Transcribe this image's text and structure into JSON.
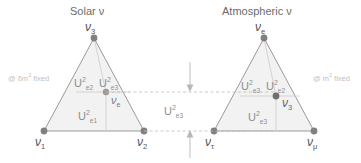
{
  "figure": {
    "type": "ternary-diagram",
    "colors": {
      "outline": "#9a9a9a",
      "fill": "#f2f2f2",
      "inner_line": "#c9c9c9",
      "dot": "#808080",
      "dashed": "#bdbdbd",
      "text": "#5a5a5a",
      "faint_text": "#c2c2c2"
    }
  },
  "panels": [
    {
      "id": "solar",
      "heading": "Solar ν",
      "apex_label": "ν",
      "apex_sub": "3",
      "left_label": "ν",
      "left_sub": "1",
      "right_label": "ν",
      "right_sub": "2",
      "inner_label": "ν",
      "inner_sub": "e",
      "note": "@ δm",
      "note_sup": "2",
      "note_tail": " fixed",
      "regions": [
        {
          "name": "upper-left",
          "base": "U",
          "sup": "2",
          "sub": "e2"
        },
        {
          "name": "upper-right",
          "base": "U",
          "sup": "2",
          "sub": "e3"
        },
        {
          "name": "lower",
          "base": "U",
          "sup": "2",
          "sub": "e1"
        }
      ]
    },
    {
      "id": "atmospheric",
      "heading": "Atmospheric ν",
      "apex_label": "ν",
      "apex_sub": "e",
      "left_label": "ν",
      "left_sub": "τ",
      "right_label": "ν",
      "right_sub": "μ",
      "inner_label": "ν",
      "inner_sub": "3",
      "note": "@ m",
      "note_sup": "2",
      "note_tail": " fixed",
      "regions": [
        {
          "name": "upper-left",
          "base": "U",
          "sup": "2",
          "sub": "e3"
        },
        {
          "name": "upper-right",
          "base": "U",
          "sup": "2",
          "sub": "e2"
        },
        {
          "name": "lower",
          "base": "U",
          "sup": "2",
          "sub": "e3"
        }
      ]
    }
  ],
  "center": {
    "label_base": "U",
    "label_sup": "2",
    "label_sub": "e3",
    "top_arrow": "down-arrow",
    "bottom_arrow": "up-arrow"
  }
}
